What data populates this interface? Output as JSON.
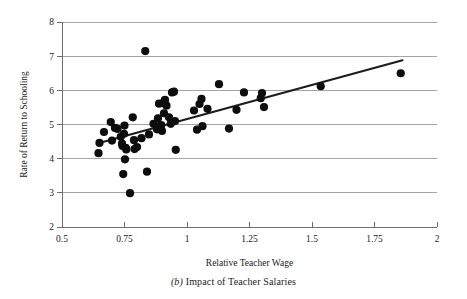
{
  "caption": {
    "panel_letter": "(b)",
    "text": "Impact of Teacher Salaries",
    "full": "(b) Impact of Teacher Salaries"
  },
  "chart_data": {
    "type": "scatter",
    "title": "",
    "xlabel": "Relative Teacher Wage",
    "ylabel": "Rate of Return to Schooling",
    "xlim": [
      0.5,
      2
    ],
    "ylim": [
      2,
      8
    ],
    "xticks": [
      0.5,
      0.75,
      1,
      1.25,
      1.5,
      1.75,
      2
    ],
    "xtick_labels": [
      "0.5",
      "0.75",
      "1",
      "1.25",
      "1.5",
      "1.75",
      "2"
    ],
    "yticks": [
      2,
      3,
      4,
      5,
      6,
      7,
      8
    ],
    "ytick_labels": [
      "2",
      "3",
      "4",
      "5",
      "6",
      "7",
      "8"
    ],
    "grid": "horizontal",
    "legend": "none",
    "marker": {
      "shape": "circle",
      "color": "#0d0d0d",
      "radius_px": 4.1
    },
    "points": [
      [
        0.646,
        4.16
      ],
      [
        0.65,
        4.46
      ],
      [
        0.668,
        4.78
      ],
      [
        0.695,
        5.07
      ],
      [
        0.7,
        4.53
      ],
      [
        0.712,
        4.9
      ],
      [
        0.722,
        4.87
      ],
      [
        0.735,
        4.64
      ],
      [
        0.74,
        4.44
      ],
      [
        0.742,
        4.37
      ],
      [
        0.748,
        4.73
      ],
      [
        0.75,
        4.97
      ],
      [
        0.752,
        3.98
      ],
      [
        0.755,
        4.32
      ],
      [
        0.757,
        4.27
      ],
      [
        0.745,
        3.55
      ],
      [
        0.772,
        2.99
      ],
      [
        0.783,
        5.21
      ],
      [
        0.788,
        4.54
      ],
      [
        0.79,
        4.28
      ],
      [
        0.8,
        4.34
      ],
      [
        0.818,
        4.6
      ],
      [
        0.833,
        7.15
      ],
      [
        0.84,
        3.62
      ],
      [
        0.848,
        4.71
      ],
      [
        0.866,
        5.02
      ],
      [
        0.88,
        4.86
      ],
      [
        0.884,
        5.18
      ],
      [
        0.888,
        5.61
      ],
      [
        0.893,
        4.95
      ],
      [
        0.897,
        4.98
      ],
      [
        0.9,
        4.81
      ],
      [
        0.903,
        5.63
      ],
      [
        0.908,
        5.33
      ],
      [
        0.912,
        5.72
      ],
      [
        0.918,
        5.55
      ],
      [
        0.928,
        5.21
      ],
      [
        0.935,
        5.02
      ],
      [
        0.94,
        5.94
      ],
      [
        0.948,
        5.96
      ],
      [
        0.952,
        5.1
      ],
      [
        0.955,
        4.26
      ],
      [
        1.028,
        5.41
      ],
      [
        1.04,
        4.85
      ],
      [
        1.05,
        5.6
      ],
      [
        1.058,
        5.75
      ],
      [
        1.062,
        4.95
      ],
      [
        1.082,
        5.46
      ],
      [
        1.128,
        6.18
      ],
      [
        1.168,
        4.88
      ],
      [
        1.198,
        5.43
      ],
      [
        1.228,
        5.94
      ],
      [
        1.295,
        5.77
      ],
      [
        1.3,
        5.92
      ],
      [
        1.308,
        5.51
      ],
      [
        1.535,
        6.12
      ],
      [
        1.855,
        6.5
      ]
    ],
    "fit_line": {
      "type": "linear-regression",
      "x_start": 0.645,
      "y_start": 4.45,
      "x_end": 1.862,
      "y_end": 6.88,
      "color": "#1c1c1c"
    }
  }
}
